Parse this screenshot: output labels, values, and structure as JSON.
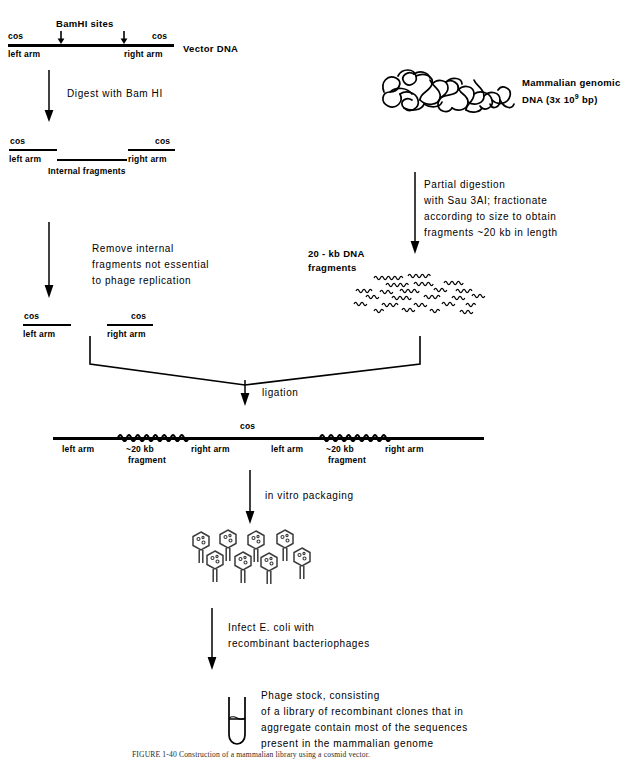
{
  "figure": {
    "caption": "FIGURE 1-40  Construction of a mammalian library using a cosmid vector."
  },
  "stage1": {
    "bamhi_label": "BamHI sites",
    "cos_left": "cos",
    "cos_right": "cos",
    "left_arm": "left arm",
    "right_arm": "right arm",
    "vector_label": "Vector DNA"
  },
  "step1": {
    "text_lines": [
      "Digest with Bam HI"
    ]
  },
  "stage2": {
    "cos_left": "cos",
    "cos_right": "cos",
    "left_arm": "left arm",
    "right_arm": "right arm",
    "internal": "Internal fragments"
  },
  "step2": {
    "text_lines": [
      "Remove internal",
      "fragments not essential",
      "to phage replication"
    ]
  },
  "stage3": {
    "cos_left": "cos",
    "cos_right": "cos",
    "left_arm": "left arm",
    "right_arm": "right arm"
  },
  "genomic": {
    "label_lines": [
      "Mammalian genomic",
      "DNA (3x 10",
      "9",
      " bp)"
    ],
    "label_line1": "Mammalian genomic",
    "label_line2_pre": "DNA (3x 10",
    "label_line2_sup": "9",
    "label_line2_post": " bp)"
  },
  "step3": {
    "text_lines": [
      "Partial digestion",
      "with Sau 3AI; fractionate",
      "according to size to obtain",
      "fragments ~20 kb in length"
    ]
  },
  "fragments": {
    "label_line1": "20 - kb DNA",
    "label_line2": "fragments"
  },
  "ligation": {
    "label": "ligation"
  },
  "concatemer": {
    "cos": "cos",
    "segments": [
      {
        "name": "left arm",
        "sub": ""
      },
      {
        "name": "~20 kb",
        "sub": "fragment"
      },
      {
        "name": "right arm",
        "sub": ""
      },
      {
        "name": "left arm",
        "sub": ""
      },
      {
        "name": "~20 kb",
        "sub": "fragment"
      },
      {
        "name": "right arm",
        "sub": ""
      }
    ]
  },
  "step4": {
    "text_lines": [
      "in vitro packaging"
    ]
  },
  "step5": {
    "text_lines": [
      "Infect E. coli with",
      "recombinant bacteriophages"
    ]
  },
  "stock": {
    "text_lines": [
      "Phage stock, consisting",
      "of a library of recombinant clones that in",
      "aggregate contain most of the sequences",
      "present in the mammalian genome"
    ]
  },
  "icons": {
    "down_arrow": "down-arrow",
    "phage": "bacteriophage",
    "tube": "test-tube",
    "dna_tangle": "tangled-dna",
    "squiggle": "squiggly-dna-fragment"
  }
}
